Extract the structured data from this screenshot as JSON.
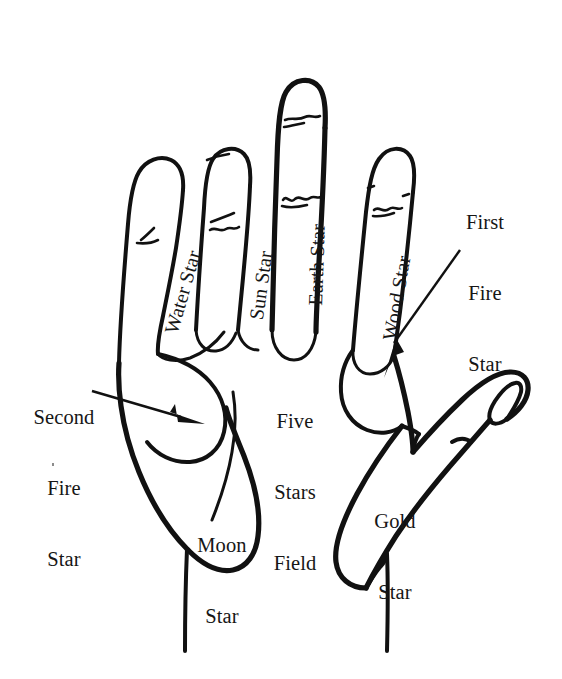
{
  "figure": {
    "background_color": "#ffffff",
    "ink_color": "#111111"
  },
  "labels": {
    "finger_water": "Water Star",
    "finger_sun": "Sun Star",
    "finger_earth": "Earth Star",
    "finger_wood": "Wood Star",
    "first_fire_star_line1": "First",
    "first_fire_star_line2": "Fire",
    "first_fire_star_line3": "Star",
    "second_fire_star_line1": "Second",
    "second_fire_star_line2": "Fire",
    "second_fire_star_line3": "Star",
    "five_stars_field_line1": "Five",
    "five_stars_field_line2": "Stars",
    "five_stars_field_line3": "Field",
    "moon_star_line1": "Moon",
    "moon_star_line2": "Star",
    "gold_star_line1": "Gold",
    "gold_star_line2": "Star"
  },
  "icons": {
    "hand_outline": "hand-outline-icon",
    "arrow_first_fire": "arrow-pointer-icon",
    "arrow_second_fire": "arrow-pointer-icon",
    "finger_crease": "crease-mark-icon"
  }
}
